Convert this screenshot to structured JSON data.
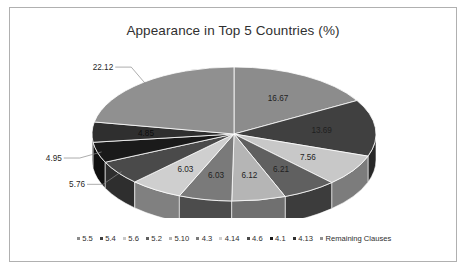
{
  "chart_data": {
    "type": "pie",
    "title": "Appearance in Top 5 Countries (%)",
    "xlabel": "",
    "ylabel": "",
    "legend_position": "bottom",
    "grid": false,
    "three_d": true,
    "categories": [
      "5.5",
      "5.4",
      "5.6",
      "5.2",
      "5.10",
      "4.3",
      "4.14",
      "4.6",
      "4.1",
      "4.13",
      "Remaining Clauses"
    ],
    "values": [
      16.67,
      13.69,
      7.56,
      6.21,
      6.12,
      6.03,
      6.03,
      5.76,
      4.95,
      4.85,
      22.12
    ],
    "labels": [
      "16.67",
      "13.69",
      "7.56",
      "6.21",
      "6.12",
      "6.03",
      "6.03",
      "5.76",
      "4.95",
      "4.85",
      "22.12"
    ],
    "colors": [
      "#8c8c8c",
      "#404040",
      "#c8c8c8",
      "#606060",
      "#b5b5b5",
      "#7a7a7a",
      "#cfcfcf",
      "#4a4a4a",
      "#1a1a1a",
      "#2f2f2f",
      "#909090"
    ],
    "slices": [
      {
        "name": "5.5",
        "value": 16.67,
        "label": "16.67",
        "color": "#8c8c8c",
        "label_style": "inside"
      },
      {
        "name": "5.4",
        "value": 13.69,
        "label": "13.69",
        "color": "#404040",
        "label_style": "inside"
      },
      {
        "name": "5.6",
        "value": 7.56,
        "label": "7.56",
        "color": "#c8c8c8",
        "label_style": "inside"
      },
      {
        "name": "5.2",
        "value": 6.21,
        "label": "6.21",
        "color": "#606060",
        "label_style": "inside"
      },
      {
        "name": "5.10",
        "value": 6.12,
        "label": "6.12",
        "color": "#b5b5b5",
        "label_style": "inside"
      },
      {
        "name": "4.3",
        "value": 6.03,
        "label": "6.03",
        "color": "#7a7a7a",
        "label_style": "inside"
      },
      {
        "name": "4.14",
        "value": 6.03,
        "label": "6.03",
        "color": "#cfcfcf",
        "label_style": "inside"
      },
      {
        "name": "4.6",
        "value": 5.76,
        "label": "5.76",
        "color": "#4a4a4a",
        "label_style": "callout"
      },
      {
        "name": "4.1",
        "value": 4.95,
        "label": "4.95",
        "color": "#1a1a1a",
        "label_style": "callout"
      },
      {
        "name": "4.13",
        "value": 4.85,
        "label": "4.85",
        "color": "#2f2f2f",
        "label_style": "inside-dark"
      },
      {
        "name": "Remaining Clauses",
        "value": 22.12,
        "label": "22.12",
        "color": "#909090",
        "label_style": "callout"
      }
    ]
  },
  "legend": {
    "items": [
      {
        "label": "5.5",
        "color": "#8c8c8c"
      },
      {
        "label": "5.4",
        "color": "#404040"
      },
      {
        "label": "5.6",
        "color": "#c8c8c8"
      },
      {
        "label": "5.2",
        "color": "#606060"
      },
      {
        "label": "5.10",
        "color": "#b5b5b5"
      },
      {
        "label": "4.3",
        "color": "#7a7a7a"
      },
      {
        "label": "4.14",
        "color": "#cfcfcf"
      },
      {
        "label": "4.6",
        "color": "#4a4a4a"
      },
      {
        "label": "4.1",
        "color": "#1a1a1a"
      },
      {
        "label": "4.13",
        "color": "#2f2f2f"
      },
      {
        "label": "Remaining Clauses",
        "color": "#909090"
      }
    ]
  },
  "frame": {
    "border_color": "#b0b0b0",
    "background": "#ffffff"
  }
}
